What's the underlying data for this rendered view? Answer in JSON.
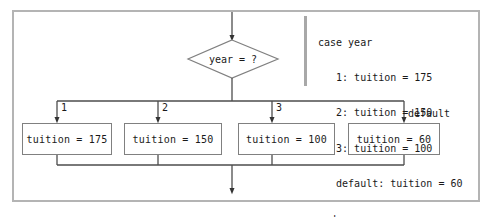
{
  "figure": {
    "type": "flowchart"
  },
  "flowchart": {
    "entry_arrow": "downward-arrow-into-decision",
    "decision": {
      "label": "year = ?",
      "shape": "diamond"
    },
    "branches": [
      {
        "label": "1",
        "box": "tuition = 175"
      },
      {
        "label": "2",
        "box": "tuition = 150"
      },
      {
        "label": "3",
        "box": "tuition = 100"
      },
      {
        "label": "default",
        "box": "tuition = 60"
      }
    ],
    "exit_arrow": "downward-arrow-out-of-merge"
  },
  "code": {
    "lines": [
      "case year",
      "   1: tuition = 175",
      "   2: tuition = 150",
      "   3: tuition = 100",
      "   default: tuition = 60",
      "endcase"
    ],
    "line_0": "case year",
    "line_1": "   1: tuition = 175",
    "line_2": "   2: tuition = 150",
    "line_3": "   3: tuition = 100",
    "line_4": "   default: tuition = 60",
    "line_5": "endcase"
  },
  "colors": {
    "frame_border": "#b4b4b4",
    "shape_border": "#808080",
    "connector": "#4d4d4d",
    "text": "#1a1a1a",
    "background": "#ffffff",
    "code_rule": "#a8a8a8"
  }
}
